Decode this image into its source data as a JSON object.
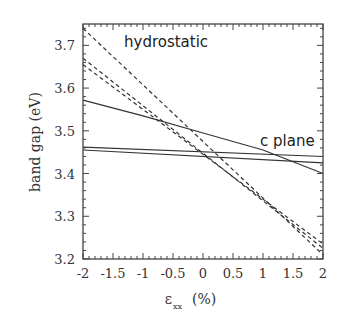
{
  "chart_data": {
    "type": "line",
    "title": "",
    "xlabel": "ε_xx (%)",
    "xlabel_main": "ε",
    "xlabel_sub": "xx",
    "xlabel_unit": "(%)",
    "ylabel": "band gap (eV)",
    "xlim": [
      -2,
      2
    ],
    "ylim": [
      3.2,
      3.75
    ],
    "xticks": [
      -2,
      -1.5,
      -1,
      -0.5,
      0,
      0.5,
      1,
      1.5,
      2
    ],
    "xtick_labels": [
      "-2",
      "-1.5",
      "-1",
      "-0.5",
      "0",
      "0.5",
      "1",
      "1.5",
      "2"
    ],
    "yticks": [
      3.2,
      3.3,
      3.4,
      3.5,
      3.6,
      3.7
    ],
    "ytick_labels": [
      "3.2",
      "3.3",
      "3.4",
      "3.5",
      "3.6",
      "3.7"
    ],
    "grid": false,
    "legend": false,
    "annotations": [
      {
        "text": "hydrostatic",
        "x": -1.35,
        "y": 3.69
      },
      {
        "text": "c plane",
        "x": 0.9,
        "y": 3.48
      }
    ],
    "series": [
      {
        "name": "hydrostatic-1",
        "style": "dashed",
        "x": [
          -2,
          2
        ],
        "y": [
          3.74,
          3.21
        ]
      },
      {
        "name": "hydrostatic-2",
        "style": "dashed",
        "x": [
          -2,
          2
        ],
        "y": [
          3.67,
          3.225
        ]
      },
      {
        "name": "hydrostatic-3",
        "style": "dashed",
        "x": [
          -2,
          2
        ],
        "y": [
          3.655,
          3.235
        ]
      },
      {
        "name": "c-plane-1",
        "style": "solid",
        "x": [
          -2,
          -1,
          0,
          1,
          2
        ],
        "y": [
          3.572,
          3.535,
          3.495,
          3.455,
          3.4
        ]
      },
      {
        "name": "c-plane-2",
        "style": "solid",
        "x": [
          -2,
          2
        ],
        "y": [
          3.462,
          3.44
        ]
      },
      {
        "name": "c-plane-3",
        "style": "solid",
        "x": [
          -2,
          2
        ],
        "y": [
          3.455,
          3.425
        ]
      }
    ]
  }
}
